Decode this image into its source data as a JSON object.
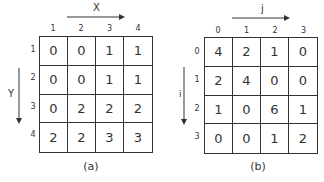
{
  "panels": [
    {
      "id": "a",
      "caption": "(a)",
      "x_axis_label": "X",
      "y_axis_label": "Y",
      "column_labels": [
        "1",
        "2",
        "3",
        "4"
      ],
      "row_labels": [
        "1",
        "2",
        "3",
        "4"
      ],
      "cells": [
        [
          "0",
          "0",
          "1",
          "1"
        ],
        [
          "0",
          "0",
          "1",
          "1"
        ],
        [
          "0",
          "2",
          "2",
          "2"
        ],
        [
          "2",
          "2",
          "3",
          "3"
        ]
      ]
    },
    {
      "id": "b",
      "caption": "(b)",
      "x_axis_label": "j",
      "y_axis_label": "i",
      "column_labels": [
        "0",
        "1",
        "2",
        "3"
      ],
      "row_labels": [
        "0",
        "1",
        "2",
        "3"
      ],
      "cells": [
        [
          "4",
          "2",
          "1",
          "0"
        ],
        [
          "2",
          "4",
          "0",
          "0"
        ],
        [
          "1",
          "0",
          "6",
          "1"
        ],
        [
          "0",
          "0",
          "1",
          "2"
        ]
      ]
    }
  ],
  "colors": {
    "line": "#333333",
    "background": "#ffffff"
  }
}
